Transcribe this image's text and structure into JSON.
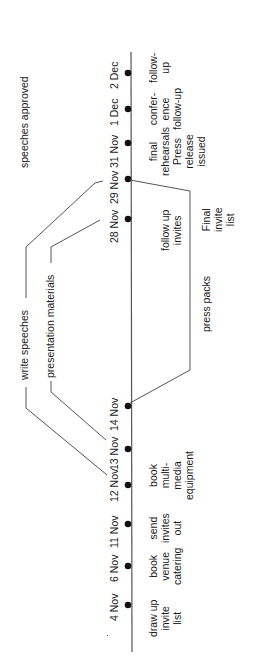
{
  "diagram": {
    "type": "timeline",
    "orientation": "rotated-90-ccw",
    "colors": {
      "line": "#555555",
      "dot": "#111111",
      "text": "#1a1a1a"
    },
    "milestones": [
      {
        "date": "4 Nov",
        "task": "draw up\ninvite\nlist"
      },
      {
        "date": "6 Nov",
        "task": "book\nvenue\ncatering"
      },
      {
        "date": "11 Nov",
        "task": "send\ninvites\nout"
      },
      {
        "date": "12 Nov",
        "task": "book\nmulti-\nmedia\nequipment"
      },
      {
        "date": "13 Nov",
        "task": ""
      },
      {
        "date": "14 Nov",
        "task": ""
      },
      {
        "date": "28 Nov",
        "task": "follow up\ninvites"
      },
      {
        "date": "29 Nov",
        "task": "Final\ninvite\nlist"
      },
      {
        "date": "31 Nov",
        "task": "final\nrehearsals\nPress\nrelease\nissued"
      },
      {
        "date": "1 Dec",
        "task": "confer-\nence\nfollow-up"
      },
      {
        "date": "2 Dec",
        "task": "follow-\nup"
      }
    ],
    "spans": [
      {
        "label": "write speeches",
        "from": "12 Nov",
        "to": "29 Nov",
        "side": "left"
      },
      {
        "label": "speeches approved",
        "at": "29 Nov",
        "side": "left"
      },
      {
        "label": "presentation materials",
        "from": "13 Nov",
        "to": "28 Nov",
        "side": "left"
      },
      {
        "label": "press packs",
        "from": "14 Nov",
        "to": "29 Nov",
        "side": "right"
      }
    ]
  }
}
